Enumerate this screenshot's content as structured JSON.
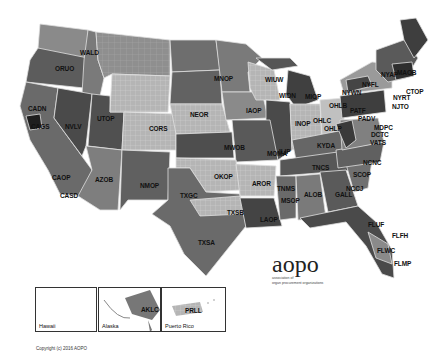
{
  "map": {
    "title": "OPO service areas",
    "colors": {
      "dark": "#3a3a3a",
      "medium_dark": "#555555",
      "medium": "#707070",
      "light": "#9a9a9a",
      "lighter": "#b8b8b8",
      "border": "#dddddd"
    },
    "labels": [
      {
        "code": "WALD",
        "x": 80,
        "y": 50
      },
      {
        "code": "ORUO",
        "x": 55,
        "y": 66
      },
      {
        "code": "CADN",
        "x": 28,
        "y": 106
      },
      {
        "code": "CAGS",
        "x": 31,
        "y": 124
      },
      {
        "code": "NVLV",
        "x": 65,
        "y": 124
      },
      {
        "code": "UTOP",
        "x": 97,
        "y": 116
      },
      {
        "code": "CAOP",
        "x": 52,
        "y": 175
      },
      {
        "code": "CASD",
        "x": 60,
        "y": 193
      },
      {
        "code": "AZOB",
        "x": 95,
        "y": 177
      },
      {
        "code": "NMOP",
        "x": 140,
        "y": 183
      },
      {
        "code": "CORS",
        "x": 149,
        "y": 126
      },
      {
        "code": "NEOR",
        "x": 190,
        "y": 112
      },
      {
        "code": "MNOP",
        "x": 214,
        "y": 76
      },
      {
        "code": "IAOP",
        "x": 246,
        "y": 108
      },
      {
        "code": "WIUW",
        "x": 265,
        "y": 77
      },
      {
        "code": "WIDN",
        "x": 279,
        "y": 93
      },
      {
        "code": "MIOP",
        "x": 305,
        "y": 94
      },
      {
        "code": "ILIP",
        "x": 279,
        "y": 149
      },
      {
        "code": "INOP",
        "x": 295,
        "y": 121
      },
      {
        "code": "OHLC",
        "x": 313,
        "y": 118
      },
      {
        "code": "OHLB",
        "x": 329,
        "y": 103
      },
      {
        "code": "OHLP",
        "x": 324,
        "y": 126
      },
      {
        "code": "KYDA",
        "x": 317,
        "y": 143
      },
      {
        "code": "MOMA",
        "x": 267,
        "y": 151
      },
      {
        "code": "MWOB",
        "x": 224,
        "y": 145
      },
      {
        "code": "OKOP",
        "x": 214,
        "y": 174
      },
      {
        "code": "TXGC",
        "x": 180,
        "y": 193
      },
      {
        "code": "TXSB",
        "x": 227,
        "y": 210
      },
      {
        "code": "TXSA",
        "x": 198,
        "y": 240
      },
      {
        "code": "AROR",
        "x": 252,
        "y": 181
      },
      {
        "code": "TNMS",
        "x": 277,
        "y": 186
      },
      {
        "code": "MSOP",
        "x": 281,
        "y": 198
      },
      {
        "code": "LAOP",
        "x": 260,
        "y": 217
      },
      {
        "code": "ALOB",
        "x": 304,
        "y": 192
      },
      {
        "code": "TNCS",
        "x": 312,
        "y": 165
      },
      {
        "code": "GALL",
        "x": 335,
        "y": 192
      },
      {
        "code": "NCCJ",
        "x": 346,
        "y": 186
      },
      {
        "code": "SCOP",
        "x": 353,
        "y": 172
      },
      {
        "code": "NCNC",
        "x": 363,
        "y": 160
      },
      {
        "code": "DCTC",
        "x": 371,
        "y": 132
      },
      {
        "code": "MDPC",
        "x": 374,
        "y": 125
      },
      {
        "code": "VATS",
        "x": 370,
        "y": 140
      },
      {
        "code": "PADV",
        "x": 358,
        "y": 116
      },
      {
        "code": "PATF",
        "x": 350,
        "y": 108
      },
      {
        "code": "NYRT",
        "x": 393,
        "y": 95
      },
      {
        "code": "NJTO",
        "x": 392,
        "y": 104
      },
      {
        "code": "CTOP",
        "x": 406,
        "y": 89
      },
      {
        "code": "NYAP",
        "x": 381,
        "y": 72
      },
      {
        "code": "MAOB",
        "x": 397,
        "y": 70
      },
      {
        "code": "NYFL",
        "x": 362,
        "y": 82
      },
      {
        "code": "NYWN",
        "x": 342,
        "y": 90
      },
      {
        "code": "FLUF",
        "x": 368,
        "y": 222
      },
      {
        "code": "FLFH",
        "x": 392,
        "y": 233
      },
      {
        "code": "FLWC",
        "x": 377,
        "y": 248
      },
      {
        "code": "FLMP",
        "x": 394,
        "y": 261
      },
      {
        "code": "HIOP",
        "x": 66,
        "y": 313
      },
      {
        "code": "AKLC",
        "x": 141,
        "y": 307
      },
      {
        "code": "PRLL",
        "x": 185,
        "y": 308
      }
    ]
  },
  "insets": [
    {
      "name": "Hawaii",
      "label": "HIOP"
    },
    {
      "name": "Alaska",
      "label": "WALC"
    },
    {
      "name": "Puerto Rico",
      "label": "PRLL"
    }
  ],
  "logo": {
    "word": "aopo",
    "subtitle_line1": "association of",
    "subtitle_line2": "organ procurement organizations"
  },
  "copyright": "Copyright (c) 2016 AOPO"
}
